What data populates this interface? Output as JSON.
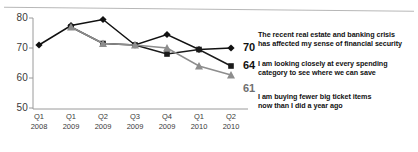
{
  "chart_data": {
    "type": "line",
    "title": "",
    "subtitle": "",
    "xlabel": "",
    "ylabel": "",
    "ylim": [
      50,
      80
    ],
    "yticks": [
      50,
      60,
      70,
      80
    ],
    "grid": false,
    "legend_position": "none",
    "categories": [
      "Q1 2008",
      "Q1 2009",
      "Q2 2009",
      "Q3 2009",
      "Q4 2009",
      "Q1 2010",
      "Q2 2010"
    ],
    "category_lines": [
      [
        "Q1",
        "2008"
      ],
      [
        "Q1",
        "2009"
      ],
      [
        "Q2",
        "2009"
      ],
      [
        "Q3",
        "2009"
      ],
      [
        "Q4",
        "2009"
      ],
      [
        "Q1",
        "2010"
      ],
      [
        "Q2",
        "2010"
      ]
    ],
    "series": [
      {
        "name": "The recent real estate and banking crisis has affected my sense of financial security",
        "marker": "diamond",
        "color": "#111111",
        "values": [
          71,
          77.5,
          79.5,
          71,
          74.5,
          69.5,
          70
        ],
        "end_value": 70
      },
      {
        "name": "I am looking closely at every spending category to see where we can save",
        "marker": "square",
        "color": "#1a1a1a",
        "values": [
          null,
          77,
          71.5,
          71,
          68,
          69.5,
          64
        ],
        "end_value": 64
      },
      {
        "name": "I am buying fewer big ticket items now than I did a year ago",
        "marker": "triangle",
        "color": "#8d8d8d",
        "values": [
          null,
          77,
          71.5,
          71,
          70,
          64,
          61
        ],
        "end_value": 61
      }
    ]
  },
  "annotations": [
    {
      "value": "70",
      "line1": "The recent real estate and banking crisis",
      "line2": "has affected my sense of financial security"
    },
    {
      "value": "64",
      "line1": "I am looking closely at every spending",
      "line2": "category to see where we can save"
    },
    {
      "value": "61",
      "line1": "I am buying fewer big ticket items",
      "line2": "now than I did a year ago"
    }
  ],
  "yticks": {
    "t80": "80",
    "t70": "70",
    "t60": "60",
    "t50": "50"
  },
  "colors": {
    "axis": "#9a9a9a",
    "series_dark": "#111111",
    "series_gray": "#8d8d8d",
    "text": "#3a3a3a"
  }
}
